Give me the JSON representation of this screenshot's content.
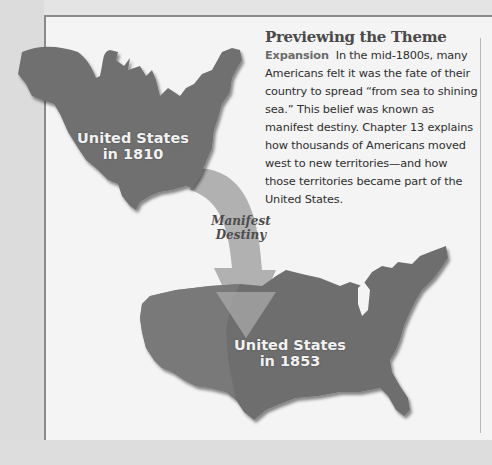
{
  "theme": {
    "heading": "Previewing the Theme",
    "keyword": "Expansion",
    "body": "In the mid-1800s, many Americans felt it was the fate of their country to spread “from sea to shining sea.” This belief was known as manifest destiny. Chapter 13 explains how thousands of Americans moved west to new territories—and how those territories became part of the United States."
  },
  "maps": {
    "map_1810": {
      "label_line1": "United States",
      "label_line2": "in 1810"
    },
    "map_1853": {
      "label_line1": "United States",
      "label_line2": "in 1853"
    }
  },
  "arrow": {
    "line1": "Manifest",
    "line2": "Destiny"
  },
  "colors": {
    "map_fill": "#6f6f6f",
    "arrow_fill": "#a9a9a9",
    "page_bg": "#f4f4f4",
    "heading": "#4a4a4a"
  }
}
